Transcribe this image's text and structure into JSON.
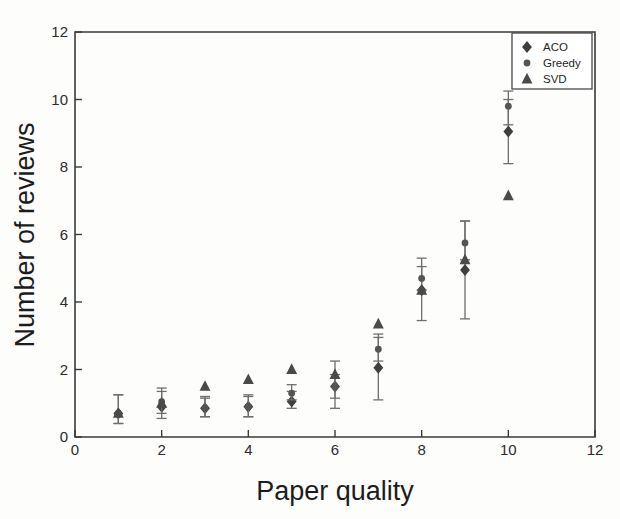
{
  "chart_data": {
    "type": "scatter",
    "title": "",
    "xlabel": "Paper quality",
    "ylabel": "Number of reviews",
    "xlim": [
      0,
      12
    ],
    "ylim": [
      0,
      12
    ],
    "xticks": [
      "0",
      "2",
      "4",
      "6",
      "8",
      "10",
      "12"
    ],
    "yticks": [
      "0",
      "2",
      "4",
      "6",
      "8",
      "10",
      "12"
    ],
    "xtick_values": [
      0,
      2,
      4,
      6,
      8,
      10,
      12
    ],
    "ytick_values": [
      0,
      2,
      4,
      6,
      8,
      10,
      12
    ],
    "grid": false,
    "legend_position": "top-right",
    "x": [
      1,
      2,
      3,
      4,
      5,
      6,
      7,
      8,
      9,
      10
    ],
    "series": [
      {
        "name": "ACO",
        "marker": "diamond",
        "color": "#3f3f3f",
        "values": [
          0.7,
          0.9,
          0.85,
          0.9,
          1.05,
          1.5,
          2.05,
          4.35,
          4.95,
          9.05
        ],
        "err_low": [
          0.3,
          0.35,
          0.25,
          0.3,
          0.2,
          0.65,
          0.95,
          0.9,
          1.45,
          0.95
        ],
        "err_high": [
          0.55,
          0.45,
          0.35,
          0.35,
          0.3,
          0.75,
          1.0,
          0.95,
          1.45,
          0.95
        ]
      },
      {
        "name": "Greedy",
        "marker": "circle",
        "color": "#555555",
        "values": [
          0.7,
          1.05,
          0.85,
          0.9,
          1.3,
          1.5,
          2.6,
          4.7,
          5.75,
          9.8
        ],
        "err_low": [
          0.3,
          0.35,
          0.25,
          0.3,
          0.2,
          0.35,
          0.35,
          0.35,
          0.5,
          0.55
        ],
        "err_high": [
          0.55,
          0.4,
          0.3,
          0.3,
          0.25,
          0.35,
          0.35,
          0.35,
          0.65,
          0.45
        ]
      },
      {
        "name": "SVD",
        "marker": "triangle",
        "color": "#4a4a4a",
        "values": [
          0.7,
          1.0,
          1.5,
          1.7,
          2.0,
          1.85,
          3.35,
          4.35,
          5.25,
          7.15
        ]
      }
    ]
  },
  "legend": {
    "entries": [
      {
        "label": "ACO",
        "marker": "diamond-icon"
      },
      {
        "label": "Greedy",
        "marker": "circle-icon"
      },
      {
        "label": "SVD",
        "marker": "triangle-icon"
      }
    ]
  }
}
